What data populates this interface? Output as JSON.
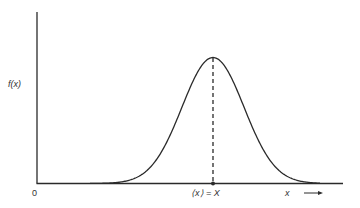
{
  "chart_data": {
    "type": "line",
    "title": "",
    "ylabel": "f(x)",
    "xlabel": "x →",
    "x_origin_label": "0",
    "mean_label": "⟨x⟩ = X",
    "grid": false,
    "legend": null,
    "series": [
      {
        "name": "f(x)",
        "shape": "gaussian",
        "center_relative": 0.57,
        "peak_height_relative": 0.88,
        "width_sigma_relative": 0.11
      }
    ],
    "annotations": [
      {
        "type": "dashed-vertical-line",
        "at": "mean",
        "label": "⟨x⟩ = X"
      },
      {
        "type": "point",
        "at": "mean-on-x-axis"
      }
    ]
  },
  "labels": {
    "y_axis": "f(x)",
    "origin": "0",
    "mean": "⟨x⟩ = X",
    "x_axis": "x"
  },
  "colors": {
    "line": "#2a2a2a",
    "background": "#ffffff"
  }
}
